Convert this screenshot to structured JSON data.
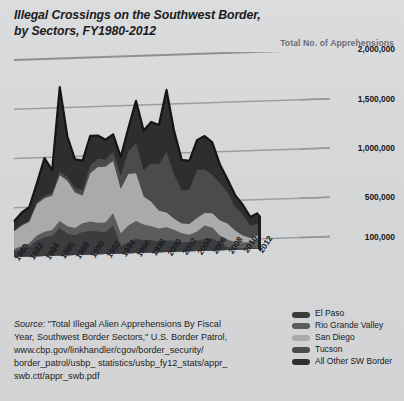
{
  "title": {
    "line1": "Illegal Crossings on the Southwest Border,",
    "line2": "by Sectors, FY1980-2012"
  },
  "axis_title": "Total No. of Apprehensions",
  "source": {
    "label": "Source:",
    "line1": " \"Total Illegal Alien Apprehensions By Fiscal",
    "line2": "Year, Southwest Border Sectors,\" U.S. Border Patrol,",
    "line3": "www.cbp.gov/linkhandler/cgov/border_security/",
    "line4": "border_patrol/usbp_ statistics/usbp_fy12_stats/appr_",
    "line5": "swb.ctt/appr_swb.pdf"
  },
  "legend": {
    "items": [
      {
        "label": "El Paso",
        "color": "#3b3c3e"
      },
      {
        "label": "Rio Grande Valley",
        "color": "#5b5c5e"
      },
      {
        "label": "San Diego",
        "color": "#a9aaac"
      },
      {
        "label": "Tucson",
        "color": "#4a4b4d"
      },
      {
        "label": "All Other SW Border",
        "color": "#2d2e30"
      }
    ]
  },
  "chart_data": {
    "type": "area",
    "stacked": true,
    "title": "Illegal Crossings on the Southwest Border, by Sectors, FY1980-2012",
    "xlabel": "",
    "ylabel": "Total No. of Apprehensions",
    "grid": true,
    "legend_position": "bottom-right",
    "ylim": [
      0,
      2000000
    ],
    "ytick_labels": [
      "2,000,000",
      "1,500,000",
      "1,000,000",
      "500,000",
      "100,000"
    ],
    "ytick_values": [
      2000000,
      1500000,
      1000000,
      500000,
      100000
    ],
    "x": [
      1980,
      1981,
      1982,
      1983,
      1984,
      1985,
      1986,
      1987,
      1988,
      1989,
      1990,
      1991,
      1992,
      1993,
      1994,
      1995,
      1996,
      1997,
      1998,
      1999,
      2000,
      2001,
      2002,
      2003,
      2004,
      2005,
      2006,
      2007,
      2008,
      2009,
      2010,
      2011,
      2012
    ],
    "xtick_labels": [
      "1980",
      "1982",
      "1984",
      "1986",
      "1988",
      "1990",
      "1992",
      "1994",
      "1996",
      "1998",
      "2000",
      "2002",
      "2004",
      "2006",
      "2008",
      "2010",
      "2012"
    ],
    "series": [
      {
        "name": "El Paso",
        "color": "#3b3c3e",
        "values": [
          58000,
          80000,
          100000,
          160000,
          190000,
          200000,
          280000,
          220000,
          200000,
          230000,
          240000,
          230000,
          220000,
          285000,
          80000,
          110000,
          145000,
          125000,
          125000,
          110000,
          115000,
          112000,
          94000,
          88000,
          104000,
          122000,
          122000,
          75000,
          30000,
          15000,
          12000,
          10000,
          9700
        ]
      },
      {
        "name": "Rio Grande Valley",
        "color": "#5b5c5e",
        "values": [
          22000,
          30000,
          35000,
          50000,
          55000,
          60000,
          70000,
          75000,
          75000,
          90000,
          95000,
          90000,
          100000,
          125000,
          125000,
          170000,
          180000,
          160000,
          140000,
          130000,
          135000,
          110000,
          90000,
          78000,
          92000,
          134000,
          111000,
          74000,
          76000,
          60000,
          60000,
          60000,
          97000
        ]
      },
      {
        "name": "San Diego",
        "color": "#a9aaac",
        "values": [
          180000,
          205000,
          215000,
          320000,
          340000,
          350000,
          465000,
          460000,
          360000,
          280000,
          490000,
          565000,
          565000,
          530000,
          450000,
          525000,
          485000,
          285000,
          250000,
          180000,
          150000,
          112000,
          100000,
          110000,
          138000,
          127000,
          143000,
          153000,
          162000,
          118000,
          68000,
          42000,
          28000
        ]
      },
      {
        "name": "Tucson",
        "color": "#4a4b4d",
        "values": [
          10000,
          12000,
          15000,
          20000,
          24000,
          28000,
          35000,
          40000,
          45000,
          55000,
          80000,
          85000,
          75000,
          92000,
          140000,
          230000,
          305000,
          270000,
          390000,
          470000,
          615000,
          450000,
          335000,
          350000,
          490000,
          440000,
          390000,
          378000,
          318000,
          241000,
          213000,
          124000,
          120000
        ]
      },
      {
        "name": "All Other SW Border",
        "color": "#2d2e30",
        "values": [
          90000,
          120000,
          135000,
          190000,
          385000,
          230000,
          860000,
          410000,
          290000,
          300000,
          300000,
          235000,
          200000,
          180000,
          185000,
          235000,
          430000,
          400000,
          420000,
          400000,
          630000,
          440000,
          310000,
          290000,
          300000,
          340000,
          330000,
          190000,
          130000,
          120000,
          100000,
          90000,
          110000
        ]
      }
    ],
    "annotations": [
      "Peak total ~1.7M in FY1986",
      "Second peak ~1.64M in FY2000",
      "Total declines to ~365K by FY2012"
    ]
  }
}
